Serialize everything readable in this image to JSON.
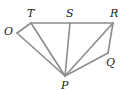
{
  "diagram": {
    "line_color": "#8c8c8c",
    "points": {
      "T": {
        "label": "T",
        "x": 31,
        "y": 23,
        "lx": 27,
        "ly": 17
      },
      "S": {
        "label": "S",
        "x": 70,
        "y": 23,
        "lx": 66,
        "ly": 17
      },
      "R": {
        "label": "R",
        "x": 113,
        "y": 23,
        "lx": 110,
        "ly": 17
      },
      "O": {
        "label": "O",
        "x": 17,
        "y": 33,
        "lx": 4,
        "ly": 35
      },
      "Q": {
        "label": "Q",
        "x": 108,
        "y": 53,
        "lx": 106,
        "ly": 66
      },
      "P": {
        "label": "P",
        "x": 65,
        "y": 76,
        "lx": 61,
        "ly": 89
      }
    },
    "segments": [
      [
        "T",
        "R"
      ],
      [
        "O",
        "T"
      ],
      [
        "O",
        "P"
      ],
      [
        "T",
        "P"
      ],
      [
        "S",
        "P"
      ],
      [
        "R",
        "P"
      ],
      [
        "R",
        "Q"
      ],
      [
        "Q",
        "P"
      ]
    ]
  }
}
